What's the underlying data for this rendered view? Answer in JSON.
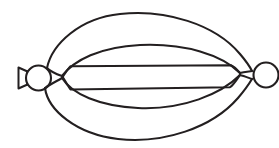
{
  "image": {
    "title": "Balloon-like lens line drawing",
    "width": 279,
    "height": 148,
    "background_color": "#ffffff",
    "stroke_color": "#231f20",
    "stroke_width": 2.1,
    "style": "black ink line drawing, no fill, no text labels"
  },
  "figure": {
    "parts": [
      {
        "name": "left-bulb",
        "type": "circle",
        "cx": 38,
        "cy": 78,
        "r": 12.5
      },
      {
        "name": "left-nozzle",
        "type": "funnel-triangle",
        "x_start": 18,
        "x_end": 27,
        "cy": 78,
        "half_height": 6
      },
      {
        "name": "right-bulb",
        "type": "circle",
        "cx": 266,
        "cy": 75,
        "r": 12.5,
        "clipped_by_right_edge": true
      },
      {
        "name": "left-vertex",
        "type": "junction-point",
        "x": 62,
        "y": 76
      },
      {
        "name": "right-vertex",
        "type": "junction-point",
        "x": 240,
        "y": 73
      },
      {
        "name": "outer-top-arc",
        "type": "arc",
        "apex_y": 14,
        "apex_x": 148
      },
      {
        "name": "outer-bottom-arc",
        "type": "arc",
        "apex_y": 139,
        "apex_x": 145
      },
      {
        "name": "inner-band-top-arc",
        "type": "arc",
        "apex_y": 46,
        "apex_x": 150
      },
      {
        "name": "inner-band-bottom-arc",
        "type": "arc",
        "apex_y": 109,
        "apex_x": 146
      },
      {
        "name": "inner-lens-top-arc",
        "type": "arc",
        "apex_y": 44,
        "apex_x": 150
      },
      {
        "name": "inner-lens-bottom-arc",
        "type": "arc",
        "apex_y": 107,
        "apex_x": 146
      },
      {
        "name": "upper-straight-line",
        "type": "line",
        "x1": 70,
        "y1": 66,
        "x2": 232,
        "y2": 65
      },
      {
        "name": "lower-straight-line",
        "type": "line",
        "x1": 70,
        "y1": 90,
        "x2": 230,
        "y2": 87
      }
    ]
  }
}
